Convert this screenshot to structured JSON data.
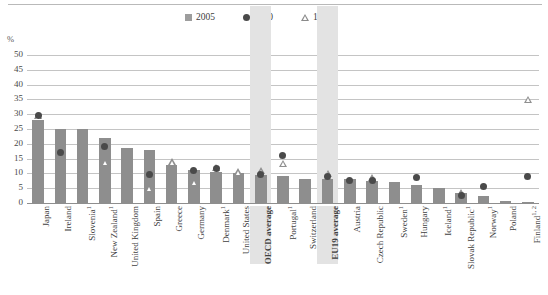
{
  "axis": {
    "unit": "%",
    "yticks": [
      "50",
      "45",
      "40",
      "35",
      "30",
      "25",
      "20",
      "15",
      "10",
      "5",
      "0"
    ]
  },
  "legend": {
    "items": [
      {
        "label": "2005",
        "marker": "square",
        "color": "#9d9d9d"
      },
      {
        "label": "2000",
        "marker": "circle",
        "color": "#4a4a4a"
      },
      {
        "label": "1995",
        "marker": "triangle",
        "color": "#8a8a8a"
      }
    ]
  },
  "chart_data": {
    "type": "bar",
    "title": "",
    "xlabel": "",
    "ylabel": "%",
    "ylim": [
      0,
      50
    ],
    "ytick_step": 5,
    "grid": true,
    "legend_position": "top-center",
    "categories": [
      "Japan",
      "Ireland",
      "Slovenia¹",
      "New Zealand¹",
      "United Kingdom",
      "Spain",
      "Greece",
      "Germany",
      "Denmark¹",
      "United States",
      "OECD average",
      "Portugal¹",
      "Switzerland",
      "EU19 average",
      "Austria",
      "Czech Republic",
      "Sweden¹",
      "Hungary",
      "Iceland¹",
      "Slovak Republic¹",
      "Norway¹",
      "Poland",
      "Finland¹²"
    ],
    "highlighted_categories": [
      "OECD average",
      "EU19 average"
    ],
    "series": [
      {
        "name": "2005",
        "marker": "bar",
        "values": [
          28.0,
          25.0,
          25.0,
          22.0,
          18.5,
          18.0,
          13.0,
          11.0,
          10.5,
          10.0,
          9.5,
          9.0,
          8.0,
          8.0,
          8.0,
          7.5,
          7.0,
          6.0,
          5.0,
          3.5,
          2.5,
          0.8,
          0.5
        ]
      },
      {
        "name": "2000",
        "marker": "circle",
        "values": [
          29.5,
          17.0,
          null,
          19.0,
          null,
          9.5,
          null,
          11.0,
          11.5,
          null,
          9.5,
          16.0,
          null,
          9.0,
          7.5,
          7.5,
          null,
          8.5,
          null,
          2.5,
          5.5,
          null,
          9.0
        ]
      },
      {
        "name": "1995",
        "marker": "triangle",
        "values": [
          29.5,
          null,
          null,
          14.0,
          null,
          5.0,
          14.0,
          7.0,
          12.0,
          10.5,
          11.0,
          13.5,
          null,
          10.0,
          null,
          8.5,
          null,
          null,
          null,
          3.5,
          null,
          null,
          35.0
        ]
      }
    ]
  }
}
